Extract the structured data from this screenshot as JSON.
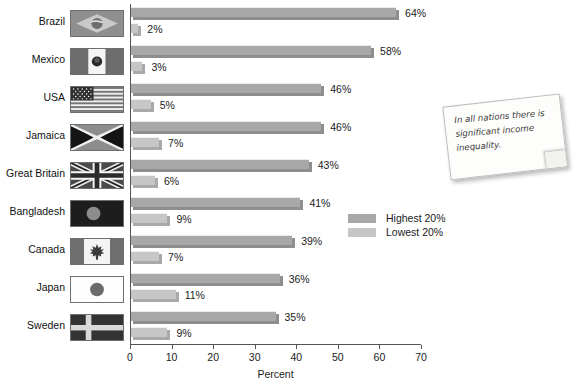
{
  "chart_data": {
    "type": "bar",
    "orientation": "horizontal",
    "title": "",
    "xlabel": "Percent",
    "ylabel": "",
    "xlim": [
      0,
      70
    ],
    "xticks": [
      0,
      10,
      20,
      30,
      40,
      50,
      60,
      70
    ],
    "grid": false,
    "legend_position": "right-middle",
    "categories": [
      "Brazil",
      "Mexico",
      "USA",
      "Jamaica",
      "Great Britain",
      "Bangladesh",
      "Canada",
      "Japan",
      "Sweden"
    ],
    "series": [
      {
        "name": "Highest 20%",
        "color": "#a8a8a8",
        "values": [
          64,
          58,
          46,
          46,
          43,
          41,
          39,
          36,
          35
        ],
        "labels": [
          "64%",
          "58%",
          "46%",
          "46%",
          "43%",
          "41%",
          "39%",
          "36%",
          "35%"
        ]
      },
      {
        "name": "Lowest 20%",
        "color": "#c6c6c6",
        "values": [
          2,
          3,
          5,
          7,
          6,
          9,
          7,
          11,
          9
        ],
        "labels": [
          "2%",
          "3%",
          "5%",
          "7%",
          "6%",
          "9%",
          "7%",
          "11%",
          "9%"
        ]
      }
    ],
    "tick_labels": [
      "0",
      "10",
      "20",
      "30",
      "40",
      "50",
      "60",
      "70"
    ],
    "flags": [
      "brazil-flag",
      "mexico-flag",
      "usa-flag",
      "jamaica-flag",
      "great-britain-flag",
      "bangladesh-flag",
      "canada-flag",
      "japan-flag",
      "sweden-flag"
    ]
  },
  "legend": {
    "items": [
      {
        "label": "Highest 20%",
        "color": "#a8a8a8"
      },
      {
        "label": "Lowest 20%",
        "color": "#c6c6c6"
      }
    ]
  },
  "annotation": {
    "text": "In all nations there is significant income inequality."
  }
}
